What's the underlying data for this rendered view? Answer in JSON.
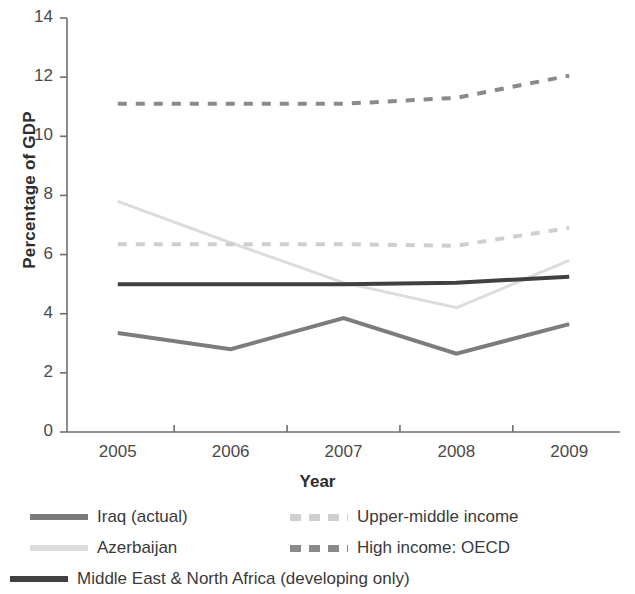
{
  "chart_data": {
    "type": "line",
    "title": "",
    "xlabel": "Year",
    "ylabel": "Percentage of GDP",
    "categories": [
      "2005",
      "2006",
      "2007",
      "2008",
      "2009"
    ],
    "x": [
      2005,
      2006,
      2007,
      2008,
      2009
    ],
    "xlim": [
      2004.55,
      2009.45
    ],
    "ylim": [
      0,
      14
    ],
    "yticks": [
      "0",
      "2",
      "4",
      "6",
      "8",
      "10",
      "12",
      "14"
    ],
    "ytick_values": [
      0,
      2,
      4,
      6,
      8,
      10,
      12,
      14
    ],
    "grid": false,
    "legend_position": "bottom",
    "series": [
      {
        "name": "Iraq (actual)",
        "values": [
          3.35,
          2.8,
          3.85,
          2.65,
          3.65
        ],
        "color": "#7c7c7c",
        "style": "solid",
        "width": 4
      },
      {
        "name": "Azerbaijan",
        "values": [
          7.8,
          6.4,
          5.05,
          4.2,
          5.8
        ],
        "color": "#dcdcdc",
        "style": "solid",
        "width": 3
      },
      {
        "name": "Middle East & North Africa (developing only)",
        "values": [
          5.0,
          5.0,
          5.0,
          5.05,
          5.25
        ],
        "color": "#404040",
        "style": "solid",
        "width": 4
      },
      {
        "name": "Upper-middle income",
        "values": [
          6.35,
          6.35,
          6.35,
          6.3,
          6.9
        ],
        "color": "#cfcfcf",
        "style": "dashed",
        "width": 4
      },
      {
        "name": "High income: OECD",
        "values": [
          11.1,
          11.1,
          11.1,
          11.3,
          12.05
        ],
        "color": "#8a8a8a",
        "style": "dashed",
        "width": 4
      }
    ]
  },
  "legend": {
    "entries": [
      {
        "label": "Iraq (actual)",
        "color": "#7c7c7c",
        "style": "solid"
      },
      {
        "label": "Upper-middle income",
        "color": "#cfcfcf",
        "style": "dashed"
      },
      {
        "label": "Azerbaijan",
        "color": "#dcdcdc",
        "style": "solid"
      },
      {
        "label": "High income: OECD",
        "color": "#8a8a8a",
        "style": "dashed"
      },
      {
        "label": "Middle East & North Africa (developing only)",
        "color": "#404040",
        "style": "solid"
      }
    ]
  },
  "axes": {
    "line_color": "#6e6e6e",
    "tick_color": "#6e6e6e"
  }
}
